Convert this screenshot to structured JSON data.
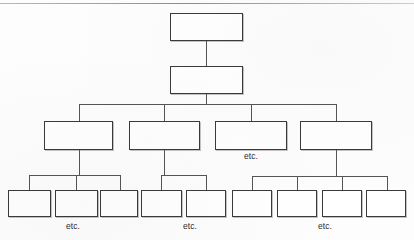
{
  "diagram": {
    "type": "hierarchy-tree",
    "canvas": {
      "width": 414,
      "height": 240,
      "background": "#fdfdfd"
    },
    "style": {
      "box_fill": "#ffffff",
      "box_border": "#3a3a3a",
      "connector_color": "#555555",
      "label_color": "#2b2b2b"
    },
    "top_rule": {
      "present": true,
      "y": 3,
      "color": "#8d8d8d"
    },
    "levels": [
      {
        "level": 1,
        "name": "root-level",
        "boxes": [
          {
            "id": "r1c1",
            "label": "",
            "x": 170,
            "y": 13,
            "w": 73,
            "h": 28
          }
        ]
      },
      {
        "level": 2,
        "name": "second-level",
        "boxes": [
          {
            "id": "r2c1",
            "label": "",
            "x": 170,
            "y": 66,
            "w": 73,
            "h": 28
          }
        ]
      },
      {
        "level": 3,
        "name": "third-level",
        "boxes": [
          {
            "id": "r3c1",
            "label": "",
            "x": 44,
            "y": 121,
            "w": 69,
            "h": 29
          },
          {
            "id": "r3c2",
            "label": "",
            "x": 129,
            "y": 121,
            "w": 71,
            "h": 29
          },
          {
            "id": "r3c3",
            "label": "",
            "x": 215,
            "y": 121,
            "w": 72,
            "h": 29
          },
          {
            "id": "r3c4",
            "label": "",
            "x": 300,
            "y": 121,
            "w": 72,
            "h": 29
          }
        ]
      },
      {
        "level": 4,
        "name": "fourth-level",
        "boxes": [
          {
            "id": "r4c1",
            "label": "",
            "x": 8,
            "y": 190,
            "w": 43,
            "h": 27
          },
          {
            "id": "r4c2",
            "label": "",
            "x": 55,
            "y": 190,
            "w": 43,
            "h": 27
          },
          {
            "id": "r4c3",
            "label": "",
            "x": 100,
            "y": 190,
            "w": 38,
            "h": 27
          },
          {
            "id": "r4c4",
            "label": "",
            "x": 141,
            "y": 190,
            "w": 41,
            "h": 27
          },
          {
            "id": "r4c5",
            "label": "",
            "x": 186,
            "y": 190,
            "w": 40,
            "h": 27
          },
          {
            "id": "r4c6",
            "label": "",
            "x": 232,
            "y": 190,
            "w": 40,
            "h": 27
          },
          {
            "id": "r4c7",
            "label": "",
            "x": 277,
            "y": 190,
            "w": 40,
            "h": 27
          },
          {
            "id": "r4c8",
            "label": "",
            "x": 322,
            "y": 190,
            "w": 40,
            "h": 27
          },
          {
            "id": "r4c9",
            "label": "",
            "x": 366,
            "y": 190,
            "w": 40,
            "h": 27
          }
        ]
      }
    ],
    "labels": [
      {
        "id": "etc-level3",
        "text": "etc.",
        "x": 251,
        "y": 151
      },
      {
        "id": "etc-branch1",
        "text": "etc.",
        "x": 73,
        "y": 221
      },
      {
        "id": "etc-branch2",
        "text": "etc.",
        "x": 190,
        "y": 221
      },
      {
        "id": "etc-branch3",
        "text": "etc.",
        "x": 325,
        "y": 221
      }
    ],
    "connectors": {
      "root_to_second": {
        "x": 206,
        "y1": 41,
        "y2": 66
      },
      "second_down_stub": {
        "x": 206,
        "y1": 94,
        "y2": 104
      },
      "level3_bus": {
        "y": 104,
        "x1": 79,
        "x2": 336
      },
      "level3_drops": [
        {
          "x": 79,
          "y1": 104,
          "y2": 121
        },
        {
          "x": 164,
          "y1": 104,
          "y2": 121
        },
        {
          "x": 251,
          "y1": 104,
          "y2": 121
        },
        {
          "x": 336,
          "y1": 104,
          "y2": 121
        }
      ],
      "branch_stubs": [
        {
          "x": 79,
          "y1": 150,
          "y2": 175
        },
        {
          "x": 164,
          "y1": 150,
          "y2": 175
        },
        {
          "x": 336,
          "y1": 150,
          "y2": 176
        }
      ],
      "branch_buses": [
        {
          "y": 175,
          "x1": 29,
          "x2": 120
        },
        {
          "y": 175,
          "x1": 161,
          "x2": 206
        },
        {
          "y": 176,
          "x1": 252,
          "x2": 387
        }
      ],
      "leaf_drops": [
        {
          "x": 29,
          "y1": 175,
          "y2": 190
        },
        {
          "x": 76,
          "y1": 175,
          "y2": 190
        },
        {
          "x": 120,
          "y1": 175,
          "y2": 190
        },
        {
          "x": 161,
          "y1": 175,
          "y2": 190
        },
        {
          "x": 206,
          "y1": 175,
          "y2": 190
        },
        {
          "x": 297,
          "y1": 176,
          "y2": 190
        },
        {
          "x": 252,
          "y1": 176,
          "y2": 190
        },
        {
          "x": 342,
          "y1": 176,
          "y2": 190
        },
        {
          "x": 387,
          "y1": 176,
          "y2": 190
        }
      ]
    }
  }
}
